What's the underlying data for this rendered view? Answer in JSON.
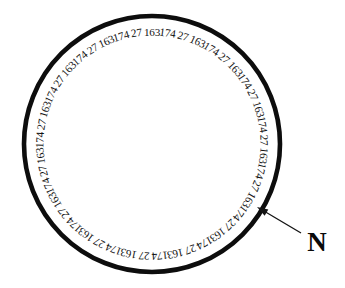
{
  "figure": {
    "title": "",
    "type": "annotated-circle-diagram",
    "background_color": "#ffffff",
    "ink_color": "#0d0d0d"
  },
  "circle": {
    "name": "ring",
    "center_x": 152,
    "center_y": 144,
    "radius": 128,
    "stroke_width": 4.6,
    "stroke_color": "#0d0d0d",
    "fill_color": "#ffffff"
  },
  "ring_labels": {
    "label_radius": 111,
    "font_size": 11.2,
    "start_angle_deg": -90,
    "count": 45,
    "repeating_cycle": [
      "163",
      "174",
      "27"
    ],
    "values": [
      "163",
      "174",
      "27",
      "163",
      "174",
      "27",
      "163",
      "174",
      "27",
      "163",
      "174",
      "27",
      "163",
      "174",
      "27",
      "163",
      "174",
      "27",
      "163",
      "174",
      "27",
      "163",
      "174",
      "27",
      "163",
      "174",
      "27",
      "163",
      "174",
      "27",
      "163",
      "174",
      "27",
      "163",
      "174",
      "27",
      "163",
      "174",
      "27",
      "163",
      "174",
      "27",
      "163",
      "174",
      "27"
    ]
  },
  "pointer": {
    "name": "north-pointer",
    "tip_x": 257,
    "tip_y": 207,
    "tail_x": 301,
    "tail_y": 233,
    "stroke_color": "#141414",
    "stroke_width": 1.25
  },
  "north": {
    "label": "N",
    "x": 317,
    "y": 245,
    "font_size": 27,
    "color": "#0a0a0a"
  }
}
